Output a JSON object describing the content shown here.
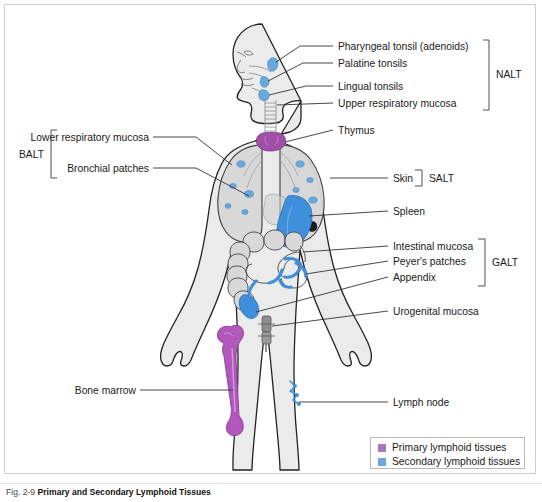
{
  "figure": {
    "number": "Fig. 2-9",
    "title": "Primary and Secondary Lymphoid Tissues"
  },
  "labels": {
    "pharyngeal_tonsil": "Pharyngeal tonsil (adenoids)",
    "palatine_tonsils": "Palatine tonsils",
    "lingual_tonsils": "Lingual tonsils",
    "upper_respiratory_mucosa": "Upper respiratory mucosa",
    "thymus": "Thymus",
    "lower_respiratory_mucosa": "Lower respiratory mucosa",
    "bronchial_patches": "Bronchial patches",
    "skin": "Skin",
    "spleen": "Spleen",
    "intestinal_mucosa": "Intestinal mucosa",
    "peyers_patches": "Peyer's patches",
    "appendix": "Appendix",
    "urogenital_mucosa": "Urogenital mucosa",
    "bone_marrow": "Bone marrow",
    "lymph_node": "Lymph node"
  },
  "groups": {
    "nalt": "NALT",
    "balt": "BALT",
    "salt": "SALT",
    "galt": "GALT"
  },
  "legend": {
    "items": [
      {
        "label": "Primary lymphoid tissues",
        "color": "#a878b8"
      },
      {
        "label": "Secondary lymphoid tissues",
        "color": "#6aa8dc"
      }
    ]
  },
  "colors": {
    "primary_tissue": "#a878b8",
    "secondary_tissue": "#6aa8dc",
    "body_fill": "#ebebeb",
    "body_outline": "#222222",
    "organ_fill": "#d8d8d8",
    "organ_outline": "#4a4a4a",
    "leader_line": "#333333",
    "frame_border": "#cfcfcf"
  }
}
